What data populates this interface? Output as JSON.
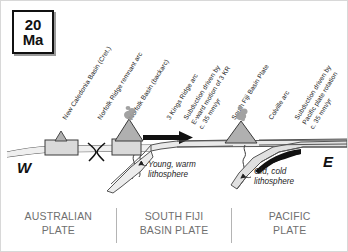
{
  "age_box": {
    "value": "20",
    "unit": "Ma"
  },
  "compass": {
    "west": "W",
    "east": "E"
  },
  "feature_labels": [
    {
      "text": "New Caledonia Basin (Cret.)",
      "x": 60,
      "y": 116
    },
    {
      "text": "Norfolk Ridge remnant arc",
      "x": 95,
      "y": 116
    },
    {
      "text": "Norfolk Basin (backarc)",
      "x": 126,
      "y": 116
    },
    {
      "text": "3 Kings Ridge arc",
      "x": 164,
      "y": 116
    },
    {
      "text": "Subduction driven by\nE-ward motion of 3 KR\nc. 35 mm/yr",
      "x": 181,
      "y": 116
    },
    {
      "text": "South Fiji Basin Plate",
      "x": 229,
      "y": 116
    },
    {
      "text": "Colville arc",
      "x": 266,
      "y": 116
    },
    {
      "text": "Subduction driven by\nPacific plate rotation\nc. 35 mm/yr",
      "x": 292,
      "y": 116
    }
  ],
  "annotations": {
    "young_lithosphere": "Young, warm\nlithosphere",
    "old_lithosphere": "Old, cold\nlithosphere"
  },
  "plates": [
    {
      "name": "AUSTRALIAN\nPLATE"
    },
    {
      "name": "SOUTH FIJI\nBASIN PLATE"
    },
    {
      "name": "PACIFIC\nPLATE"
    }
  ],
  "colors": {
    "crust_fill": "#d9d9d9",
    "crust_stroke": "#3a3a3a",
    "volcano_fill": "#b0b0b0",
    "plume": "#9a9a9a",
    "arrow": "#111111",
    "plate_text": "#6f6f6f",
    "label_text": "#232323"
  },
  "section_elements": {
    "spreading_center": "spreading-ridge-symbol",
    "arrow_label": "eastward-motion-arrow",
    "slab_west": "young-warm-slab",
    "slab_east": "old-cold-slab",
    "volcano_west": "three-kings-ridge-volcano",
    "volcano_east": "colville-arc-volcano",
    "ridge_block_west": "norfolk-ridge-block"
  }
}
